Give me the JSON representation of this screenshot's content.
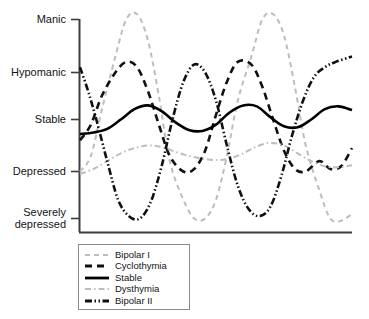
{
  "chart_data": {
    "type": "line",
    "title": "",
    "xlabel": "",
    "ylabel": "",
    "grid": false,
    "legend_position": "bottom-left",
    "y_tick_labels": [
      "Manic",
      "Hypomanic",
      "Stable",
      "Depressed",
      "Severely depressed"
    ],
    "y_tick_values": [
      5,
      4,
      3,
      2,
      1
    ],
    "ylim": [
      0.55,
      5.2
    ],
    "xlim": [
      0,
      100
    ],
    "x_tick_labels": [],
    "series": [
      {
        "name": "Bipolar I",
        "color": "#bdbdbd",
        "style": "dashed",
        "width": 2.0,
        "x": [
          0,
          4,
          8,
          13,
          17,
          21,
          25,
          29,
          33,
          38,
          42,
          46,
          50,
          54,
          58,
          63,
          67,
          71,
          75,
          79,
          83,
          88,
          92,
          96,
          100
        ],
        "y": [
          2.0,
          2.3,
          3.2,
          4.3,
          5.0,
          5.1,
          4.6,
          3.5,
          2.2,
          1.4,
          1.0,
          1.0,
          1.4,
          2.3,
          3.4,
          4.3,
          5.0,
          5.1,
          4.7,
          3.7,
          2.5,
          1.6,
          1.0,
          0.95,
          1.1
        ]
      },
      {
        "name": "Cyclothymia",
        "color": "#111111",
        "style": "dashed",
        "width": 2.6,
        "x": [
          0,
          4,
          8,
          13,
          17,
          21,
          25,
          29,
          33,
          38,
          42,
          46,
          50,
          54,
          58,
          63,
          67,
          71,
          75,
          79,
          83,
          88,
          92,
          96,
          100
        ],
        "y": [
          2.6,
          2.9,
          3.5,
          4.0,
          4.2,
          4.1,
          3.6,
          2.9,
          2.3,
          2.0,
          2.05,
          2.4,
          3.1,
          3.8,
          4.2,
          4.15,
          3.7,
          3.0,
          2.4,
          2.05,
          2.0,
          2.2,
          2.05,
          2.1,
          2.45
        ]
      },
      {
        "name": "Stable",
        "color": "#000000",
        "style": "solid",
        "width": 2.6,
        "x": [
          0,
          5,
          10,
          15,
          20,
          25,
          30,
          35,
          40,
          45,
          50,
          55,
          60,
          65,
          70,
          75,
          80,
          85,
          90,
          95,
          100
        ],
        "y": [
          2.72,
          2.75,
          2.82,
          3.0,
          3.22,
          3.3,
          3.18,
          2.95,
          2.8,
          2.78,
          2.9,
          3.15,
          3.3,
          3.28,
          3.05,
          2.87,
          2.85,
          3.0,
          3.22,
          3.28,
          3.2
        ]
      },
      {
        "name": "Dysthymia",
        "color": "#bdbdbd",
        "style": "dashdot",
        "width": 2.0,
        "x": [
          0,
          5,
          10,
          15,
          20,
          25,
          30,
          35,
          40,
          45,
          50,
          55,
          60,
          65,
          70,
          75,
          80,
          85,
          90,
          95,
          100
        ],
        "y": [
          1.95,
          2.05,
          2.2,
          2.35,
          2.45,
          2.5,
          2.47,
          2.38,
          2.3,
          2.25,
          2.22,
          2.25,
          2.35,
          2.48,
          2.55,
          2.5,
          2.35,
          2.2,
          2.1,
          2.08,
          2.12
        ]
      },
      {
        "name": "Bipolar II",
        "color": "#111111",
        "style": "dashdotdot",
        "width": 2.6,
        "x": [
          0,
          3,
          6,
          10,
          14,
          18,
          22,
          26,
          30,
          34,
          38,
          42,
          46,
          50,
          54,
          58,
          62,
          66,
          70,
          74,
          78,
          82,
          86,
          90,
          94,
          100
        ],
        "y": [
          4.1,
          3.6,
          3.0,
          2.2,
          1.4,
          1.05,
          1.0,
          1.35,
          2.1,
          3.0,
          3.8,
          4.15,
          4.0,
          3.4,
          2.5,
          1.7,
          1.2,
          1.05,
          1.25,
          1.9,
          2.7,
          3.4,
          3.9,
          4.1,
          4.2,
          4.3
        ]
      }
    ]
  },
  "legend": {
    "items": [
      {
        "label": "Bipolar I",
        "swatch": "dashed-gray"
      },
      {
        "label": "Cyclothymia",
        "swatch": "dashed-black"
      },
      {
        "label": "Stable",
        "swatch": "solid-black"
      },
      {
        "label": "Dysthymia",
        "swatch": "dashdot-gray"
      },
      {
        "label": "Bipolar II",
        "swatch": "dashdotdot-black"
      }
    ]
  },
  "axis": {
    "axis_color": "#3d3d3d",
    "tick_color": "#3d3d3d"
  }
}
